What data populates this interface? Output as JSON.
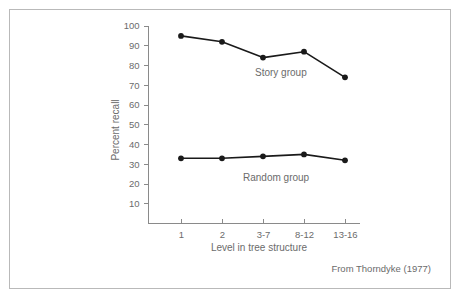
{
  "figure": {
    "attribution": "From Thorndyke (1977)",
    "border_color": "#b9b9b9",
    "background_color": "#ffffff"
  },
  "chart_data": {
    "type": "line",
    "title": "",
    "subtitle": "",
    "xlabel": "Level in tree structure",
    "ylabel": "Percent recall",
    "categories": [
      "1",
      "2",
      "3-7",
      "8-12",
      "13-16"
    ],
    "yticks": [
      10,
      20,
      30,
      40,
      50,
      60,
      70,
      80,
      90,
      100
    ],
    "ytick_labels": [
      "10",
      "20",
      "30",
      "40",
      "50",
      "60",
      "70",
      "80",
      "90",
      "100"
    ],
    "ylim": [
      0,
      100
    ],
    "grid": false,
    "legend_position": "inline-annotation",
    "series": [
      {
        "name": "Story group",
        "label": "Story group",
        "color": "#1a1a1a",
        "marker": "filled-circle",
        "values": [
          95,
          92,
          84,
          87,
          74
        ]
      },
      {
        "name": "Random group",
        "label": "Random group",
        "color": "#1a1a1a",
        "marker": "filled-circle",
        "values": [
          33,
          33,
          34,
          35,
          32
        ]
      }
    ],
    "annotations": [
      {
        "text": "Story group",
        "series": "Story group"
      },
      {
        "text": "Random group",
        "series": "Random group"
      }
    ]
  }
}
